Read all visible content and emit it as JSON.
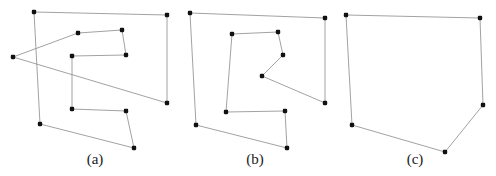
{
  "figure": {
    "width": 496,
    "height": 176,
    "background_color": "#ffffff",
    "edge_color": "#8a8a8a",
    "vertex_color": "#111111",
    "caption_color": "#1a1a1a"
  },
  "panels": [
    {
      "id": "a",
      "caption": "(a)",
      "caption_x": 95,
      "caption_y": 152,
      "description": "self-intersecting polygon",
      "closed": true,
      "points": [
        [
          34,
          12
        ],
        [
          167,
          15
        ],
        [
          167,
          103
        ],
        [
          13,
          57
        ],
        [
          78,
          33
        ],
        [
          122,
          30
        ],
        [
          126,
          55
        ],
        [
          72,
          56
        ],
        [
          72,
          109
        ],
        [
          126,
          111
        ],
        [
          134,
          148
        ],
        [
          40,
          124
        ]
      ]
    },
    {
      "id": "b",
      "caption": "(b)",
      "caption_x": 255,
      "caption_y": 152,
      "description": "simple polygon",
      "closed": true,
      "points": [
        [
          190,
          13
        ],
        [
          325,
          18
        ],
        [
          325,
          103
        ],
        [
          262,
          76
        ],
        [
          283,
          55
        ],
        [
          278,
          32
        ],
        [
          232,
          34
        ],
        [
          226,
          112
        ],
        [
          285,
          111
        ],
        [
          287,
          148
        ],
        [
          196,
          125
        ]
      ]
    },
    {
      "id": "c",
      "caption": "(c)",
      "caption_x": 415,
      "caption_y": 152,
      "description": "convex hull",
      "closed": true,
      "points": [
        [
          346,
          15
        ],
        [
          480,
          18
        ],
        [
          483,
          105
        ],
        [
          445,
          152
        ],
        [
          352,
          125
        ]
      ]
    }
  ]
}
